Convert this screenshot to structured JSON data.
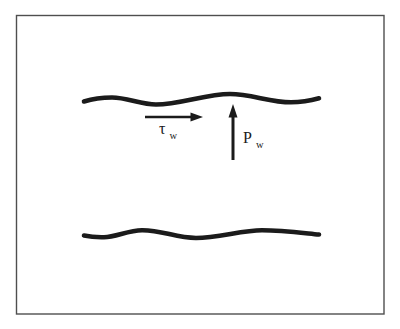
{
  "diagram": {
    "labels": {
      "shear": {
        "symbol": "τ",
        "subscript": "w"
      },
      "pressure": {
        "symbol": "P",
        "subscript": "w"
      }
    },
    "colors": {
      "line": "#1b1b1b",
      "border": "#4f4f4f",
      "background": "#ffffff"
    }
  }
}
